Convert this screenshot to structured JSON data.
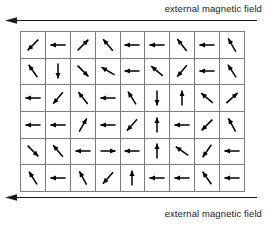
{
  "figure": {
    "colors": {
      "background": "#ffffff",
      "grid_line": "#7d7d7d",
      "arrow": "#000000",
      "text": "#1a1a1a"
    }
  },
  "labels": {
    "top": "external magnetic field",
    "bottom": "external magnetic field"
  },
  "field_arrows": {
    "top": {
      "direction": "left",
      "name": "field-direction-arrow-top"
    },
    "bottom": {
      "direction": "left",
      "name": "field-direction-arrow-bottom"
    }
  },
  "chart_data": {
    "type": "vector-field-grid",
    "title": "external magnetic field",
    "columns": 9,
    "rows": 6,
    "field_direction_degrees": 180,
    "angle_convention": "degrees, 0 = pointing right, 90 = pointing up, 180 = pointing left, 270 = pointing down",
    "cells": [
      [
        {
          "dir": "down-left",
          "angle": 225
        },
        {
          "dir": "left",
          "angle": 180
        },
        {
          "dir": "up-right",
          "angle": 45
        },
        {
          "dir": "up-left",
          "angle": 130
        },
        {
          "dir": "left",
          "angle": 180
        },
        {
          "dir": "left",
          "angle": 180
        },
        {
          "dir": "up-left",
          "angle": 128
        },
        {
          "dir": "left",
          "angle": 180
        },
        {
          "dir": "up-left",
          "angle": 120
        }
      ],
      [
        {
          "dir": "up-left",
          "angle": 125
        },
        {
          "dir": "down",
          "angle": 270
        },
        {
          "dir": "down-right",
          "angle": 315
        },
        {
          "dir": "up-left",
          "angle": 150
        },
        {
          "dir": "left",
          "angle": 180
        },
        {
          "dir": "up-left",
          "angle": 140
        },
        {
          "dir": "down-left",
          "angle": 230
        },
        {
          "dir": "left",
          "angle": 180
        },
        {
          "dir": "up-left",
          "angle": 123
        }
      ],
      [
        {
          "dir": "left",
          "angle": 180
        },
        {
          "dir": "down-left",
          "angle": 230
        },
        {
          "dir": "up-left",
          "angle": 128
        },
        {
          "dir": "left",
          "angle": 180
        },
        {
          "dir": "up-left",
          "angle": 122
        },
        {
          "dir": "down",
          "angle": 270
        },
        {
          "dir": "up",
          "angle": 90
        },
        {
          "dir": "up-left",
          "angle": 140
        },
        {
          "dir": "up-right",
          "angle": 42
        }
      ],
      [
        {
          "dir": "left",
          "angle": 180
        },
        {
          "dir": "left",
          "angle": 180
        },
        {
          "dir": "up-right",
          "angle": 60
        },
        {
          "dir": "left",
          "angle": 180
        },
        {
          "dir": "down-left",
          "angle": 228
        },
        {
          "dir": "up",
          "angle": 90
        },
        {
          "dir": "left",
          "angle": 180
        },
        {
          "dir": "down-left",
          "angle": 225
        },
        {
          "dir": "up-left",
          "angle": 118
        }
      ],
      [
        {
          "dir": "down-right",
          "angle": 315
        },
        {
          "dir": "up-left",
          "angle": 130
        },
        {
          "dir": "left",
          "angle": 180
        },
        {
          "dir": "right",
          "angle": 0
        },
        {
          "dir": "left",
          "angle": 180
        },
        {
          "dir": "up",
          "angle": 90
        },
        {
          "dir": "up-left",
          "angle": 145
        },
        {
          "dir": "down-left",
          "angle": 235
        },
        {
          "dir": "left",
          "angle": 180
        }
      ],
      [
        {
          "dir": "up-left",
          "angle": 122
        },
        {
          "dir": "left",
          "angle": 180
        },
        {
          "dir": "up-left",
          "angle": 118
        },
        {
          "dir": "down-left",
          "angle": 228
        },
        {
          "dir": "up",
          "angle": 90
        },
        {
          "dir": "left",
          "angle": 180
        },
        {
          "dir": "left",
          "angle": 180
        },
        {
          "dir": "up-left",
          "angle": 125
        },
        {
          "dir": "left",
          "angle": 180
        }
      ]
    ]
  }
}
